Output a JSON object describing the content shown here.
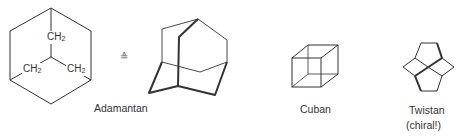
{
  "figure": {
    "molecules": [
      {
        "name": "Adamantan",
        "note": ""
      },
      {
        "name": "Cuban",
        "note": ""
      },
      {
        "name": "Twistan",
        "note": "(chiral!)"
      }
    ],
    "adamantane_2d": {
      "groups": [
        "CH",
        "CH",
        "CH"
      ],
      "subscript": "2"
    },
    "equivalence_symbol": "≙",
    "colors": {
      "line": "#333333",
      "background": "#ffffff"
    }
  }
}
